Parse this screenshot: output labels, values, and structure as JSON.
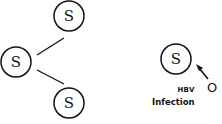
{
  "diagram": {
    "left_tree": {
      "nodes": [
        {
          "id": "top",
          "label": "S",
          "cx": 69,
          "cy": 16
        },
        {
          "id": "root",
          "label": "S",
          "cx": 16,
          "cy": 62
        },
        {
          "id": "bottom",
          "label": "S",
          "cx": 69,
          "cy": 103
        }
      ],
      "edges": [
        {
          "from": "root",
          "to": "top"
        },
        {
          "from": "root",
          "to": "bottom"
        }
      ]
    },
    "right_infection": {
      "node": {
        "label": "S",
        "cx": 176,
        "cy": 60
      },
      "agent_label": "O",
      "virus_label": "HBV",
      "caption": "Infection"
    },
    "colors": {
      "stroke": "#111111",
      "background": "#ffffff"
    }
  }
}
